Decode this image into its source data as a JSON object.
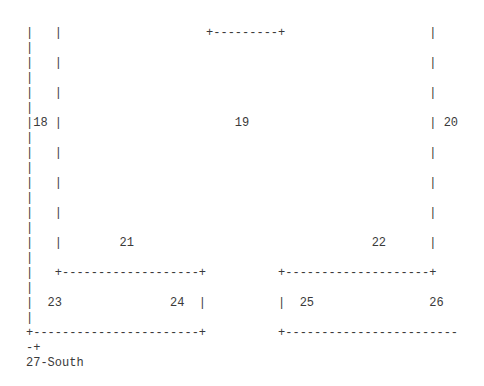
{
  "diagram": {
    "type": "ascii-floor-plan",
    "lines": [
      "|   |                    +---------+                    |",
      "|",
      "|   |                                                   |",
      "|",
      "|   |                                                   |",
      "|",
      "|18 |                        19                         | 20",
      "|",
      "|   |                                                   |",
      "|",
      "|   |                                                   |",
      "|",
      "|   |                                                   |",
      "|",
      "|   |        21                                 22      |",
      "|",
      "|   +-------------------+          +--------------------+",
      "|",
      "|  23               24  |          |  25                26",
      "|",
      "+-----------------------+          +------------------------",
      "-+",
      "27-South"
    ],
    "rooms": [
      {
        "id": "18"
      },
      {
        "id": "19"
      },
      {
        "id": "20"
      },
      {
        "id": "21"
      },
      {
        "id": "22"
      },
      {
        "id": "23"
      },
      {
        "id": "24"
      },
      {
        "id": "25"
      },
      {
        "id": "26"
      },
      {
        "id": "27",
        "label": "27-South"
      }
    ]
  }
}
